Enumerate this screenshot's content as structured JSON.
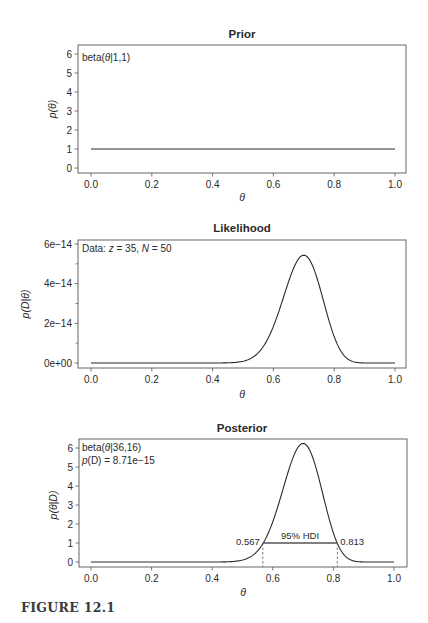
{
  "figure": {
    "caption": "FIGURE 12.1"
  },
  "chart_data": [
    {
      "type": "line",
      "title": "Prior",
      "xlabel": "θ",
      "ylabel": "p(θ)",
      "xlim": [
        0,
        1
      ],
      "ylim": [
        0,
        6
      ],
      "x_ticks": [
        "0.0",
        "0.2",
        "0.4",
        "0.6",
        "0.8",
        "1.0"
      ],
      "y_ticks": [
        "0",
        "1",
        "2",
        "3",
        "4",
        "5",
        "6"
      ],
      "grid": false,
      "annotations": [
        "beta(θ|1,1)"
      ],
      "distribution": {
        "kind": "beta",
        "a": 1,
        "b": 1
      },
      "series": [
        {
          "name": "prior",
          "x": [
            0.0,
            0.2,
            0.4,
            0.6,
            0.8,
            1.0
          ],
          "y": [
            1,
            1,
            1,
            1,
            1,
            1
          ]
        }
      ]
    },
    {
      "type": "line",
      "title": "Likelihood",
      "xlabel": "θ",
      "ylabel": "p(D|θ)",
      "xlim": [
        0,
        1
      ],
      "ylim": [
        0,
        6e-14
      ],
      "x_ticks": [
        "0.0",
        "0.2",
        "0.4",
        "0.6",
        "0.8",
        "1.0"
      ],
      "y_ticks": [
        "0e+00",
        "2e-14",
        "4e-14",
        "6e-14"
      ],
      "grid": false,
      "annotations": [
        "Data: z = 35, N = 50"
      ],
      "data": {
        "z": 35,
        "N": 50
      },
      "series": [
        {
          "name": "likelihood",
          "x": [
            0.0,
            0.4,
            0.5,
            0.6,
            0.7,
            0.8,
            0.9,
            1.0
          ],
          "y": [
            0,
            1.7e-16,
            2.8e-15,
            2.7e-14,
            5.4e-14,
            1.6e-14,
            2.6e-17,
            0
          ]
        }
      ]
    },
    {
      "type": "line",
      "title": "Posterior",
      "xlabel": "θ",
      "ylabel": "p(θ|D)",
      "xlim": [
        0,
        1
      ],
      "ylim": [
        0,
        6
      ],
      "x_ticks": [
        "0.0",
        "0.2",
        "0.4",
        "0.6",
        "0.8",
        "1.0"
      ],
      "y_ticks": [
        "0",
        "1",
        "2",
        "3",
        "4",
        "5",
        "6"
      ],
      "grid": false,
      "annotations": [
        "beta(θ|36,16)",
        "p(D) = 8.71e-15"
      ],
      "distribution": {
        "kind": "beta",
        "a": 36,
        "b": 16
      },
      "evidence": "8.71e-15",
      "hdi": {
        "label": "95% HDI",
        "low": 0.567,
        "high": 0.813,
        "low_label": "0.567",
        "high_label": "0.813",
        "height": 1.0
      },
      "series": [
        {
          "name": "posterior",
          "x": [
            0.0,
            0.4,
            0.5,
            0.567,
            0.6,
            0.7,
            0.8,
            0.813,
            0.9,
            1.0
          ],
          "y": [
            0,
            0.02,
            0.32,
            1.0,
            1.7,
            6.25,
            2.1,
            1.0,
            0.003,
            0
          ]
        }
      ]
    }
  ],
  "panels": {
    "prior": {
      "title": "Prior",
      "xlabel": "θ",
      "ylabel_p": "p",
      "ylabel_rest": "(θ)",
      "annotation_1_prefix": "beta(",
      "annotation_1_theta": "θ",
      "annotation_1_suffix": "|1,1)"
    },
    "likelihood": {
      "title": "Likelihood",
      "xlabel": "θ",
      "ylabel_p": "p",
      "ylabel_rest": "(D|θ)",
      "annotation_1_prefix": "Data: ",
      "annotation_1_z": "z",
      "annotation_1_mid": " = 35, ",
      "annotation_1_N": "N",
      "annotation_1_suffix": " = 50"
    },
    "posterior": {
      "title": "Posterior",
      "xlabel": "θ",
      "ylabel_p": "p",
      "ylabel_rest": "(θ|D)",
      "annotation_1_prefix": "beta(",
      "annotation_1_theta": "θ",
      "annotation_1_suffix": "|36,16)",
      "annotation_2_p": "p",
      "annotation_2_mid": "(D)",
      "annotation_2_suffix": " = 8.71e−15",
      "hdi_label": "95% HDI",
      "hdi_low_label": "0.567",
      "hdi_high_label": "0.813"
    }
  },
  "axis_ticks": {
    "x": [
      "0.0",
      "0.2",
      "0.4",
      "0.6",
      "0.8",
      "1.0"
    ],
    "y_density": [
      "0",
      "1",
      "2",
      "3",
      "4",
      "5",
      "6"
    ],
    "y_likelihood": [
      "0e+00",
      "2e−14",
      "4e−14",
      "6e−14"
    ]
  },
  "colors": {
    "line": "#2b2b2b",
    "frame": "#555555",
    "text": "#2a2a2a",
    "background": "#ffffff"
  }
}
